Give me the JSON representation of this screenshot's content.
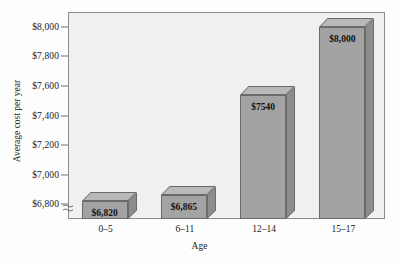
{
  "chart_data": {
    "type": "bar",
    "title": "",
    "xlabel": "Age",
    "ylabel": "Average cost per year",
    "categories": [
      "0–5",
      "6–11",
      "12–14",
      "15–17"
    ],
    "values": [
      6820,
      6865,
      7540,
      8000
    ],
    "value_labels": [
      "$6,820",
      "$6,865",
      "$7540",
      "$8,000"
    ],
    "ytick_labels": [
      "$8,000",
      "$7,800",
      "$7,600",
      "$7,400",
      "$7,200",
      "$7,000",
      "$6,800"
    ],
    "ytick_values": [
      8000,
      7800,
      7600,
      7400,
      7200,
      7000,
      6800
    ],
    "ylim": [
      6700,
      8100
    ],
    "axis_break": true,
    "grid": false,
    "legend": null,
    "style": {
      "bar_face_color": "#a3a3a3",
      "bar_top_color": "#b9b9b9",
      "bar_side_color": "#8d8d8d",
      "bar_edge_color": "#6b6b6b",
      "plot_background": "#f0f0ef",
      "page_background": "#fdfdfd",
      "text_color": "#1a1a1a"
    }
  }
}
